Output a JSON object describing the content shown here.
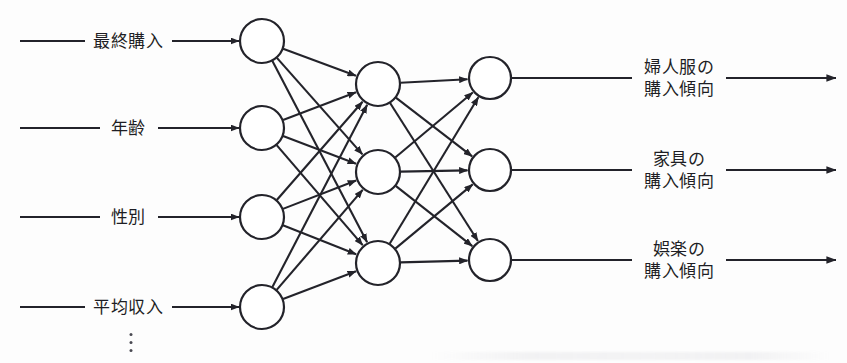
{
  "diagram": {
    "type": "neural-network",
    "title": "",
    "stroke_color": "#23232a",
    "node_fill": "#ffffff",
    "background": "#fdfdfd",
    "layers": [
      {
        "name": "input",
        "node_count": 4,
        "cx": 262,
        "r": 22,
        "cys": [
          41,
          128,
          217,
          307
        ]
      },
      {
        "name": "hidden",
        "node_count": 3,
        "cx": 378,
        "r": 22,
        "cys": [
          84,
          172,
          263
        ]
      },
      {
        "name": "output",
        "node_count": 3,
        "cx": 490,
        "r": 21,
        "cys": [
          78,
          170,
          260
        ]
      }
    ],
    "connections": {
      "input_to_hidden": "fully-connected",
      "hidden_to_output": "fully-connected",
      "input_to_hidden_count": 12,
      "hidden_to_output_count": 9
    }
  },
  "inputs": [
    {
      "label": "最終購入",
      "y": 41,
      "leader_x1": 20,
      "leader_x2": 85,
      "text_x": 128,
      "arrow_x1": 172,
      "arrow_x2": 238
    },
    {
      "label": "年齢",
      "y": 128,
      "leader_x1": 20,
      "leader_x2": 100,
      "text_x": 128,
      "arrow_x1": 158,
      "arrow_x2": 238
    },
    {
      "label": "性別",
      "y": 217,
      "leader_x1": 20,
      "leader_x2": 100,
      "text_x": 128,
      "arrow_x1": 158,
      "arrow_x2": 238
    },
    {
      "label": "平均収入",
      "y": 307,
      "leader_x1": 20,
      "leader_x2": 85,
      "text_x": 128,
      "arrow_x1": 172,
      "arrow_x2": 238
    }
  ],
  "input_ellipsis": {
    "glyph": "⋮",
    "x": 131,
    "y": 340
  },
  "outputs": [
    {
      "line1": "婦人服の",
      "line2": "購入傾向",
      "y": 78,
      "leader_x1": 511,
      "leader_x2": 632,
      "text_x": 679,
      "arrow_x1": 726,
      "arrow_x2": 836
    },
    {
      "line1": "家具の",
      "line2": "購入傾向",
      "y": 170,
      "leader_x1": 511,
      "leader_x2": 632,
      "text_x": 679,
      "arrow_x1": 726,
      "arrow_x2": 836
    },
    {
      "line1": "娯楽の",
      "line2": "購入傾向",
      "y": 260,
      "leader_x1": 511,
      "leader_x2": 632,
      "text_x": 679,
      "arrow_x1": 726,
      "arrow_x2": 836
    }
  ]
}
